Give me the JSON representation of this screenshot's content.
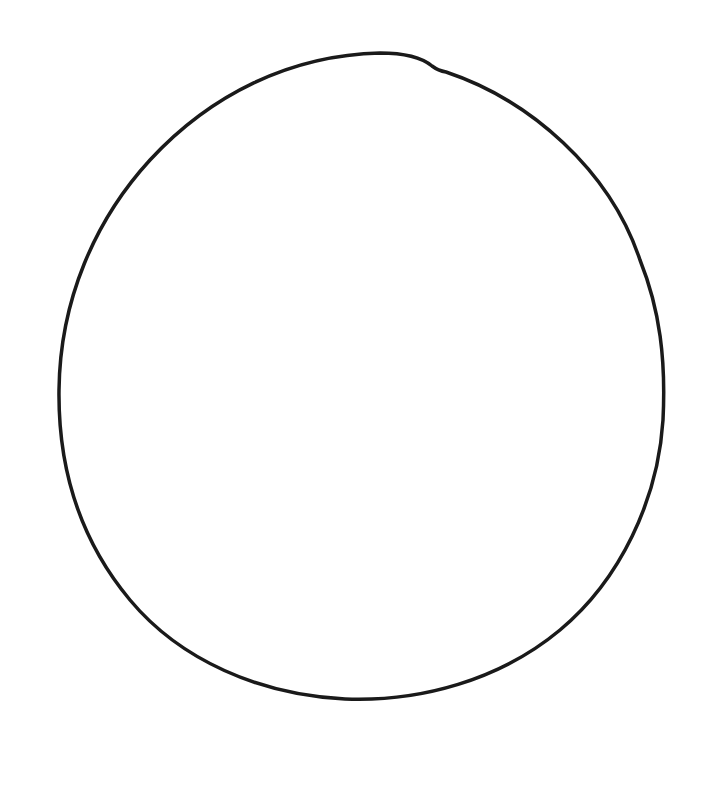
{
  "drawing": {
    "title": "Hand-drawn circle",
    "background": "#ffffff",
    "stroke_color": "#1a1a1a",
    "stroke_width": 3.5,
    "shape": "circle-outline",
    "bounds": {
      "left": 58,
      "top": 52,
      "right": 665,
      "bottom": 700
    }
  }
}
